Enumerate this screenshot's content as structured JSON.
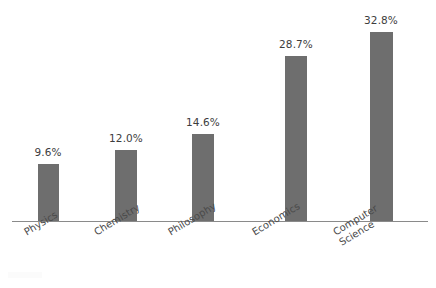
{
  "chart_data": {
    "type": "bar",
    "title": "",
    "subtitle": "",
    "xlabel": "",
    "ylabel": "",
    "ylim": [
      0,
      36
    ],
    "grid": false,
    "legend": "none",
    "bar_color": "#6e6e6e",
    "axis_color": "#8a8a8a",
    "label_color": "#3d3d3d",
    "tick_color": "#4a4a4a",
    "categories": [
      "Physics",
      "Chemistry",
      "Philosophy",
      "Economics",
      "Computer\nScience"
    ],
    "values": [
      9.6,
      12.0,
      14.6,
      28.7,
      32.8
    ],
    "value_labels": [
      "9.6%",
      "12.0%",
      "14.6%",
      "28.7%",
      "32.8%"
    ],
    "tick_labels": [
      "Physics",
      "Chemistry",
      "Philosophy",
      "Economics",
      "Computer\nScience"
    ]
  },
  "bars": [
    {
      "label": "Physics",
      "value": 9.6,
      "value_label": "9.6%",
      "x": 38,
      "width": 21,
      "height": 58,
      "center": 48,
      "top": 163,
      "label_x": 48,
      "label_y": 146,
      "tick_x": 22,
      "tick_y": 6
    },
    {
      "label": "Chemistry",
      "value": 12.0,
      "value_label": "12.0%",
      "x": 115,
      "width": 22,
      "height": 72,
      "center": 126,
      "top": 149,
      "label_x": 126,
      "label_y": 132,
      "tick_x": 92,
      "tick_y": 6
    },
    {
      "label": "Philosophy",
      "value": 14.6,
      "value_label": "14.6%",
      "x": 192,
      "width": 22,
      "height": 88,
      "center": 203,
      "top": 133,
      "label_x": 203,
      "label_y": 116,
      "tick_x": 166,
      "tick_y": 6
    },
    {
      "label": "Economics",
      "value": 28.7,
      "value_label": "28.7%",
      "x": 285,
      "width": 22,
      "height": 166,
      "center": 296,
      "top": 55,
      "label_x": 296,
      "label_y": 38,
      "tick_x": 250,
      "tick_y": 6
    },
    {
      "label": "Computer Science",
      "value": 32.8,
      "value_label": "32.8%",
      "x": 370,
      "width": 23,
      "height": 190,
      "center": 381,
      "top": 31,
      "label_x": 381,
      "label_y": 14,
      "tick_x": 331,
      "tick_y": 6
    }
  ]
}
